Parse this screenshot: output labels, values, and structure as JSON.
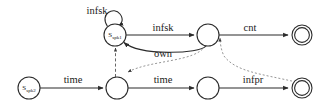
{
  "diagram": {
    "type": "finite-state-automaton",
    "background_color": "#ffffff",
    "stroke_color": "#2b2b2b",
    "dashed_color": "#555555",
    "dotted_color": "#8a8a8a"
  },
  "states": [
    {
      "id": "s_spk1",
      "label_main": "S",
      "label_sub": "spk1",
      "kind": "labeled",
      "accepting": false,
      "cx": 115,
      "cy": 35,
      "r": 11
    },
    {
      "id": "t1",
      "label_main": "",
      "label_sub": "",
      "kind": "plain",
      "accepting": false,
      "cx": 208,
      "cy": 35,
      "r": 11
    },
    {
      "id": "f1",
      "label_main": "",
      "label_sub": "",
      "kind": "accepting",
      "accepting": true,
      "cx": 302,
      "cy": 35,
      "r": 10
    },
    {
      "id": "s_spk2",
      "label_main": "S",
      "label_sub": "spk2",
      "kind": "labeled",
      "accepting": false,
      "cx": 29,
      "cy": 88,
      "r": 11
    },
    {
      "id": "t2",
      "label_main": "",
      "label_sub": "",
      "kind": "plain",
      "accepting": false,
      "cx": 117,
      "cy": 88,
      "r": 11
    },
    {
      "id": "t3",
      "label_main": "",
      "label_sub": "",
      "kind": "plain",
      "accepting": false,
      "cx": 208,
      "cy": 88,
      "r": 11
    },
    {
      "id": "f2",
      "label_main": "",
      "label_sub": "",
      "kind": "accepting",
      "accepting": true,
      "cx": 302,
      "cy": 88,
      "r": 10
    }
  ],
  "transitions": [
    {
      "id": "loop-infsk",
      "label": "infsk",
      "from": "s_spk1",
      "to": "s_spk1",
      "style": "solid",
      "shape": "self-loop",
      "label_x": 97,
      "label_y": 14
    },
    {
      "id": "edge-infsk",
      "label": "infsk",
      "from": "s_spk1",
      "to": "t1",
      "style": "solid",
      "shape": "straight",
      "label_x": 163,
      "label_y": 31
    },
    {
      "id": "edge-cnt",
      "label": "cnt",
      "from": "t1",
      "to": "f1",
      "style": "solid",
      "shape": "straight",
      "label_x": 250,
      "label_y": 31
    },
    {
      "id": "edge-own",
      "label": "own",
      "from": "t1",
      "to": "s_spk1",
      "style": "solid",
      "shape": "curve-below",
      "label_x": 163,
      "label_y": 57
    },
    {
      "id": "edge-time-1",
      "label": "time",
      "from": "s_spk2",
      "to": "t2",
      "style": "solid",
      "shape": "straight",
      "label_x": 73,
      "label_y": 83
    },
    {
      "id": "edge-time-2",
      "label": "time",
      "from": "t2",
      "to": "t3",
      "style": "solid",
      "shape": "straight",
      "label_x": 163,
      "label_y": 83
    },
    {
      "id": "edge-infpr",
      "label": "infpr",
      "from": "t3",
      "to": "f2",
      "style": "solid",
      "shape": "straight",
      "label_x": 253,
      "label_y": 83
    },
    {
      "id": "sync-dashed-up",
      "label": "",
      "from": "t2",
      "to": "s_spk1",
      "style": "dashed",
      "shape": "vertical",
      "label_x": 0,
      "label_y": 0
    },
    {
      "id": "sync-dotted-t1-t2",
      "label": "",
      "from": "t1",
      "to": "t2",
      "style": "dotted",
      "shape": "curve",
      "label_x": 0,
      "label_y": 0
    },
    {
      "id": "sync-dotted-f2-t1",
      "label": "",
      "from": "f2",
      "to": "t1",
      "style": "dotted",
      "shape": "curve",
      "label_x": 0,
      "label_y": 0
    }
  ]
}
